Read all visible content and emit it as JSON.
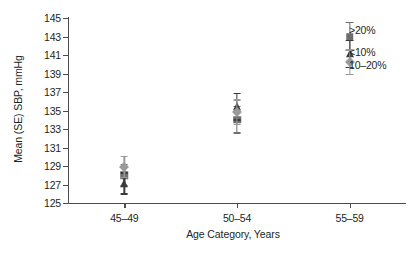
{
  "chart_data": {
    "type": "scatter",
    "title": "",
    "xlabel": "Age Category, Years",
    "ylabel": "Mean (SE) SBP, mmHg",
    "categories": [
      "45–49",
      "50–54",
      "55–59"
    ],
    "ylim": [
      125,
      145
    ],
    "ytick_step": 2,
    "yticks": [
      145,
      143,
      141,
      139,
      137,
      135,
      133,
      131,
      129,
      127,
      125
    ],
    "ytick_labels": [
      "145",
      "143",
      "141",
      "139",
      "137",
      "135",
      "133",
      "131",
      "129",
      "127",
      "125"
    ],
    "grid": false,
    "legend_position": "top-right",
    "series": [
      {
        "name": ">20%",
        "marker": "square",
        "color": "#6e6e6e",
        "values": [
          128.0,
          134.0,
          143.0
        ],
        "errors": [
          1.2,
          1.5,
          1.6
        ]
      },
      {
        "name": "<10%",
        "marker": "triangle",
        "color": "#3a3a3a",
        "values": [
          127.1,
          135.4,
          141.1
        ],
        "errors": [
          1.2,
          1.5,
          1.5
        ]
      },
      {
        "name": "10–20%",
        "marker": "diamond",
        "color": "#9a9a9a",
        "values": [
          128.9,
          134.8,
          140.2
        ],
        "errors": [
          1.2,
          1.4,
          1.4
        ]
      }
    ]
  },
  "legend": {
    "items": [
      {
        "label": ">20%"
      },
      {
        "label": "<10%"
      },
      {
        "label": "10–20%"
      }
    ]
  },
  "axes": {
    "x_title": "Age Category, Years",
    "y_title": "Mean (SE) SBP, mmHg"
  },
  "colors": {
    "axis": "#4d4d4d",
    "text": "#231f20",
    "series_gt20": "#6e6e6e",
    "series_lt10": "#3a3a3a",
    "series_10to20": "#9a9a9a",
    "background": "#ffffff"
  }
}
